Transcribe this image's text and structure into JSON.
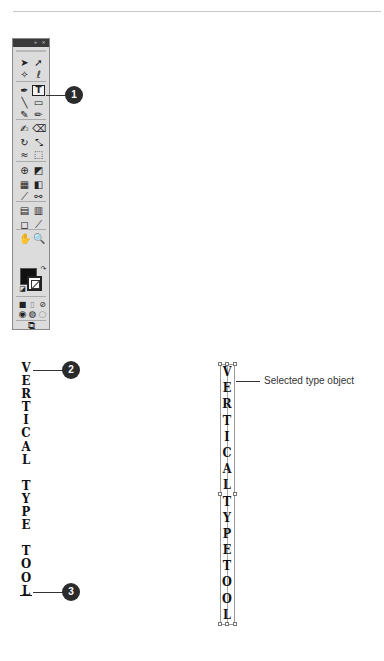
{
  "toolbox": {
    "title_buttons": [
      "»",
      "×"
    ],
    "tools": [
      {
        "name": "selection-tool",
        "glyph": "➤"
      },
      {
        "name": "direct-selection-tool",
        "glyph": "➚"
      },
      {
        "name": "magic-wand-tool",
        "glyph": "✧"
      },
      {
        "name": "lasso-tool",
        "glyph": "ℓ"
      },
      {
        "name": "pen-tool",
        "glyph": "✒"
      },
      {
        "name": "vertical-type-tool",
        "glyph": "T"
      },
      {
        "name": "line-segment-tool",
        "glyph": "╲"
      },
      {
        "name": "rectangle-tool",
        "glyph": "▭"
      },
      {
        "name": "paintbrush-tool",
        "glyph": "✎"
      },
      {
        "name": "pencil-tool",
        "glyph": "✏"
      },
      {
        "name": "blob-brush-tool",
        "glyph": "✍"
      },
      {
        "name": "eraser-tool",
        "glyph": "⌫"
      },
      {
        "name": "rotate-tool",
        "glyph": "↻"
      },
      {
        "name": "scale-tool",
        "glyph": "⤡"
      },
      {
        "name": "warp-tool",
        "glyph": "≈"
      },
      {
        "name": "free-transform-tool",
        "glyph": "⬚"
      },
      {
        "name": "shape-builder-tool",
        "glyph": "⊕"
      },
      {
        "name": "perspective-grid-tool",
        "glyph": "◩"
      },
      {
        "name": "mesh-tool",
        "glyph": "▦"
      },
      {
        "name": "gradient-tool",
        "glyph": "◧"
      },
      {
        "name": "eyedropper-tool",
        "glyph": "⟋"
      },
      {
        "name": "blend-tool",
        "glyph": "⚯"
      },
      {
        "name": "symbol-sprayer-tool",
        "glyph": "▤"
      },
      {
        "name": "column-graph-tool",
        "glyph": "▥"
      },
      {
        "name": "artboard-tool",
        "glyph": "◻"
      },
      {
        "name": "slice-tool",
        "glyph": "⟋"
      },
      {
        "name": "hand-tool",
        "glyph": "✋"
      },
      {
        "name": "zoom-tool",
        "glyph": "🔍"
      }
    ],
    "mode_buttons": [
      "■",
      "▯",
      "⊘"
    ],
    "draw_mode_buttons": [
      "◉",
      "◍",
      "○"
    ],
    "screen_mode_glyph": "⧉"
  },
  "callouts": {
    "one": "1",
    "two": "2",
    "three": "3"
  },
  "left_text": [
    "V",
    "E",
    "R",
    "T",
    "I",
    "C",
    "A",
    "L",
    " ",
    "T",
    "Y",
    "P",
    "E",
    " ",
    "T",
    "O",
    "O",
    "L"
  ],
  "right_text": [
    "V",
    "E",
    "R",
    "T",
    "I",
    "C",
    "A",
    "L",
    "T",
    "Y",
    "P",
    "E",
    "T",
    "O",
    "O",
    "L"
  ],
  "selected_label": "Selected type object"
}
